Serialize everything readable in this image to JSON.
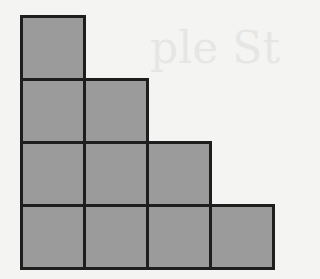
{
  "diagram": {
    "type": "staircase-grid",
    "column_heights": [
      4,
      3,
      2,
      1
    ],
    "total_squares": 10,
    "cell_size_px": 63,
    "origin": {
      "x": 21,
      "y": 16
    },
    "colors": {
      "fill": "#9b9b9b",
      "border": "#1e1e1e",
      "background": "#f4f4f3"
    }
  },
  "background_bleed_text": "ple St"
}
